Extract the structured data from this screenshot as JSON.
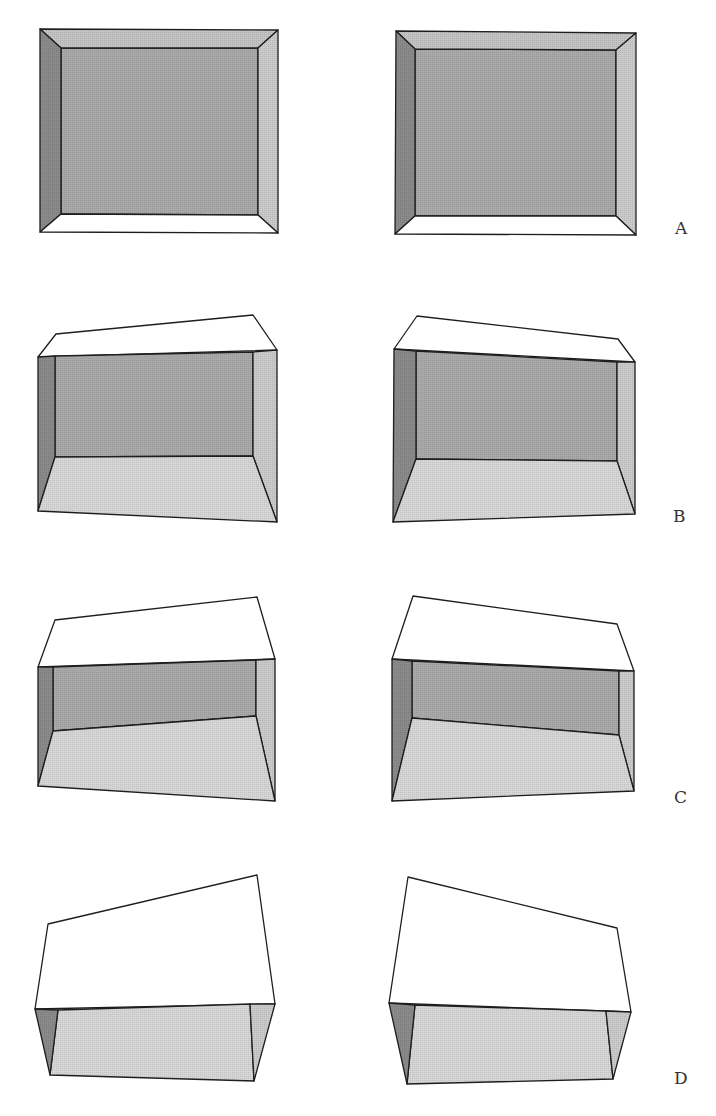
{
  "figure": {
    "colors": {
      "back_wall": "#a9a9a9",
      "left_wall": "#8a8a8a",
      "right_wall": "#cacaca",
      "ceiling": "#c3c3c3",
      "floor": "#d6d6d6",
      "lid": "#ffffff",
      "stroke": "#1e1e1e"
    },
    "rows": [
      {
        "label": "A",
        "label_pos": [
          675,
          234
        ],
        "views": [
          {
            "side": "left",
            "faces": [
              {
                "name": "back-wall",
                "fill": "back_wall",
                "points": "61,48 258,48 258,215 61,214"
              },
              {
                "name": "ceiling",
                "fill": "ceiling",
                "points": "40,29 278,30 258,48 61,48"
              },
              {
                "name": "left-wall",
                "fill": "left_wall",
                "points": "40,29 61,48 61,214 40,232"
              },
              {
                "name": "right-wall",
                "fill": "right_wall",
                "points": "278,30 278,233 258,215 258,48"
              },
              {
                "name": "floor",
                "fill": "lid",
                "points": "61,214 258,215 278,233 40,232"
              }
            ]
          },
          {
            "side": "right",
            "faces": [
              {
                "name": "back-wall",
                "fill": "back_wall",
                "points": "415,49 616,50 616,216 415,216"
              },
              {
                "name": "ceiling",
                "fill": "ceiling",
                "points": "396,31 636,33 616,50 415,49"
              },
              {
                "name": "left-wall",
                "fill": "left_wall",
                "points": "396,31 415,49 415,216 395,234"
              },
              {
                "name": "right-wall",
                "fill": "right_wall",
                "points": "636,33 636,235 616,216 616,50"
              },
              {
                "name": "floor",
                "fill": "lid",
                "points": "415,216 616,216 636,235 395,234"
              }
            ]
          }
        ]
      },
      {
        "label": "B",
        "label_pos": [
          673,
          522
        ],
        "views": [
          {
            "side": "left",
            "faces": [
              {
                "name": "lid",
                "fill": "lid",
                "points": "56,334 253,315 277,350 38,357"
              },
              {
                "name": "back-wall",
                "fill": "back_wall",
                "points": "55,356 253,352 253,456 55,457"
              },
              {
                "name": "left-wall",
                "fill": "left_wall",
                "points": "38,357 55,356 55,457 38,511"
              },
              {
                "name": "right-wall",
                "fill": "right_wall",
                "points": "253,352 277,350 277,522 253,456"
              },
              {
                "name": "floor",
                "fill": "floor",
                "points": "55,457 253,456 277,522 38,511"
              }
            ]
          },
          {
            "side": "right",
            "faces": [
              {
                "name": "lid",
                "fill": "lid",
                "points": "417,316 618,339 635,362 394,349"
              },
              {
                "name": "back-wall",
                "fill": "back_wall",
                "points": "416,351 617,362 617,461 416,459"
              },
              {
                "name": "left-wall",
                "fill": "left_wall",
                "points": "394,349 416,351 416,459 393,522"
              },
              {
                "name": "right-wall",
                "fill": "right_wall",
                "points": "617,362 635,362 635,514 617,461"
              },
              {
                "name": "floor",
                "fill": "floor",
                "points": "416,459 617,461 635,514 393,522"
              }
            ]
          }
        ]
      },
      {
        "label": "C",
        "label_pos": [
          674,
          803
        ],
        "views": [
          {
            "side": "left",
            "faces": [
              {
                "name": "lid",
                "fill": "lid",
                "points": "55,620 257,597 275,659 38,667"
              },
              {
                "name": "back-wall",
                "fill": "back_wall",
                "points": "53,667 256,660 256,716 53,731"
              },
              {
                "name": "left-wall",
                "fill": "left_wall",
                "points": "38,667 53,667 53,731 38,786"
              },
              {
                "name": "right-wall",
                "fill": "right_wall",
                "points": "256,660 275,659 275,801 256,716"
              },
              {
                "name": "floor",
                "fill": "floor",
                "points": "53,731 256,716 275,801 38,786"
              }
            ]
          },
          {
            "side": "right",
            "faces": [
              {
                "name": "lid",
                "fill": "lid",
                "points": "413,596 617,624 634,671 392,659"
              },
              {
                "name": "back-wall",
                "fill": "back_wall",
                "points": "412,661 619,671 619,735 412,718"
              },
              {
                "name": "left-wall",
                "fill": "left_wall",
                "points": "392,659 412,661 412,718 392,801"
              },
              {
                "name": "right-wall",
                "fill": "right_wall",
                "points": "619,671 634,671 634,791 619,735"
              },
              {
                "name": "floor",
                "fill": "floor",
                "points": "412,718 619,735 634,791 392,801"
              }
            ]
          }
        ]
      },
      {
        "label": "D",
        "label_pos": [
          674,
          1084
        ],
        "views": [
          {
            "side": "left",
            "faces": [
              {
                "name": "lid",
                "fill": "lid",
                "points": "48,924 257,875 275,1004 35,1009"
              },
              {
                "name": "floor",
                "fill": "floor",
                "points": "58,1010 250,1004 254,1081 50,1075"
              },
              {
                "name": "left-wall",
                "fill": "left_wall",
                "points": "35,1009 58,1010 50,1075"
              },
              {
                "name": "right-wall",
                "fill": "right_wall",
                "points": "250,1004 275,1004 254,1081"
              }
            ]
          },
          {
            "side": "right",
            "faces": [
              {
                "name": "lid",
                "fill": "lid",
                "points": "408,877 617,928 631,1012 389,1003"
              },
              {
                "name": "floor",
                "fill": "floor",
                "points": "415,1005 606,1011 613,1079 407,1084"
              },
              {
                "name": "left-wall",
                "fill": "left_wall",
                "points": "389,1003 415,1005 407,1084"
              },
              {
                "name": "right-wall",
                "fill": "right_wall",
                "points": "606,1011 631,1012 613,1079"
              }
            ]
          }
        ]
      }
    ]
  }
}
